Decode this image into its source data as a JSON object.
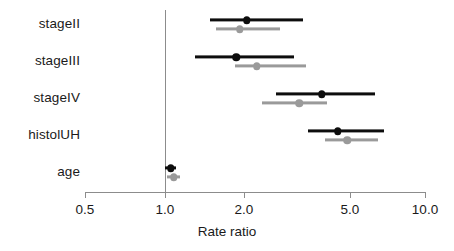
{
  "chart_data": {
    "type": "scatter",
    "subtype": "forest-plot",
    "title": "",
    "xlabel": "Rate ratio",
    "ylabel": "",
    "xscale": "log",
    "xlim": [
      0.5,
      10.0
    ],
    "xticks": [
      0.5,
      1.0,
      2.0,
      5.0,
      10.0
    ],
    "xtick_labels": [
      "0.5",
      "1.0",
      "2.0",
      "5.0",
      "10.0"
    ],
    "grid": false,
    "legend": "none",
    "reference_line": 1.0,
    "categories": [
      "stageII",
      "stageIII",
      "stageIV",
      "histolUH",
      "age"
    ],
    "series": [
      {
        "name": "black",
        "color": "#0d0d0d",
        "estimates": [
          2.05,
          1.87,
          3.95,
          4.55,
          1.05
        ],
        "ci_lower": [
          1.49,
          1.3,
          2.65,
          3.5,
          1.0
        ],
        "ci_upper": [
          3.35,
          3.1,
          6.3,
          6.8,
          1.1
        ]
      },
      {
        "name": "gray",
        "color": "#9a9a9a",
        "estimates": [
          1.93,
          2.24,
          3.25,
          4.95,
          1.08
        ],
        "ci_lower": [
          1.57,
          1.85,
          2.35,
          4.05,
          1.02
        ],
        "ci_upper": [
          2.73,
          3.45,
          4.15,
          6.5,
          1.14
        ]
      }
    ]
  },
  "axis": {
    "x_title": "Rate ratio",
    "tick_0": "0.5",
    "tick_1": "1.0",
    "tick_2": "2.0",
    "tick_3": "5.0",
    "tick_4": "10.0"
  },
  "labels": {
    "row_0": "stageII",
    "row_1": "stageIII",
    "row_2": "stageIV",
    "row_3": "histolUH",
    "row_4": "age"
  }
}
